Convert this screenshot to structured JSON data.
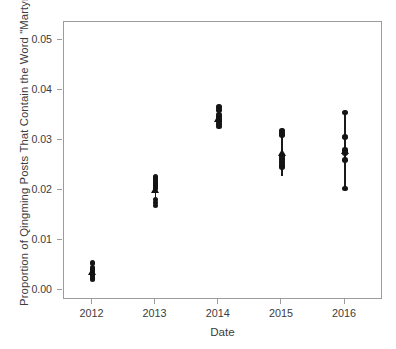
{
  "chart_data": {
    "type": "scatter",
    "title": "",
    "xlabel": "Date",
    "ylabel": "Proportion of Qingming Posts That Contain the Word \"Martyr\"",
    "grid": false,
    "legend": "none",
    "xlim": [
      2011.55,
      2016.6
    ],
    "ylim": [
      -0.0019,
      0.0538
    ],
    "x_tick_labels": [
      "2012",
      "2013",
      "2014",
      "2015",
      "2016"
    ],
    "x_tick_values": [
      2012,
      2013,
      2014,
      2015,
      2016
    ],
    "y_tick_labels": [
      "0.00",
      "0.01",
      "0.02",
      "0.03",
      "0.04",
      "0.05"
    ],
    "y_tick_values": [
      0.0,
      0.01,
      0.02,
      0.03,
      0.04,
      0.05
    ],
    "marker_point": "filled-circle",
    "marker_mean": "filled-triangle",
    "range_bar": "vertical-line-min-to-max",
    "series": [
      {
        "name": "2012",
        "x": 2012,
        "values": [
          0.0055,
          0.0046,
          0.0043,
          0.0039,
          0.0035,
          0.003,
          0.00255,
          0.00225
        ],
        "mean": 0.0037,
        "min": 0.00225,
        "max": 0.0046
      },
      {
        "name": "2013",
        "x": 2013,
        "values": [
          0.0227,
          0.0223,
          0.0217,
          0.0214,
          0.0211,
          0.0208,
          0.0204,
          0.0182,
          0.0176,
          0.017
        ],
        "mean": 0.0202,
        "min": 0.0176,
        "max": 0.0223
      },
      {
        "name": "2014",
        "x": 2014,
        "values": [
          0.0368,
          0.0362,
          0.0352,
          0.0349,
          0.0344,
          0.034,
          0.0334,
          0.0329
        ],
        "mean": 0.0344,
        "min": 0.0329,
        "max": 0.0352
      },
      {
        "name": "2015",
        "x": 2015,
        "values": [
          0.0321,
          0.0316,
          0.0311,
          0.027,
          0.0264,
          0.0258,
          0.0252,
          0.0247
        ],
        "mean": 0.0276,
        "min": 0.023,
        "max": 0.0321
      },
      {
        "name": "2016",
        "x": 2016,
        "values": [
          0.0357,
          0.0308,
          0.0282,
          0.0276,
          0.0261,
          0.0204
        ],
        "mean": 0.028,
        "min": 0.0204,
        "max": 0.0357
      }
    ]
  },
  "axis": {
    "y_ticks": [
      {
        "label": "0.05",
        "value": 0.05
      },
      {
        "label": "0.04",
        "value": 0.04
      },
      {
        "label": "0.03",
        "value": 0.03
      },
      {
        "label": "0.02",
        "value": 0.02
      },
      {
        "label": "0.01",
        "value": 0.01
      },
      {
        "label": "0.00",
        "value": 0.0
      }
    ],
    "x_ticks": [
      {
        "label": "2012",
        "value": 2012
      },
      {
        "label": "2013",
        "value": 2013
      },
      {
        "label": "2014",
        "value": 2014
      },
      {
        "label": "2015",
        "value": 2015
      },
      {
        "label": "2016",
        "value": 2016
      }
    ]
  },
  "colors": {
    "marker": "#151515",
    "axis": "#9c9c9c",
    "text": "#3c3c3c",
    "background": "#ffffff"
  }
}
